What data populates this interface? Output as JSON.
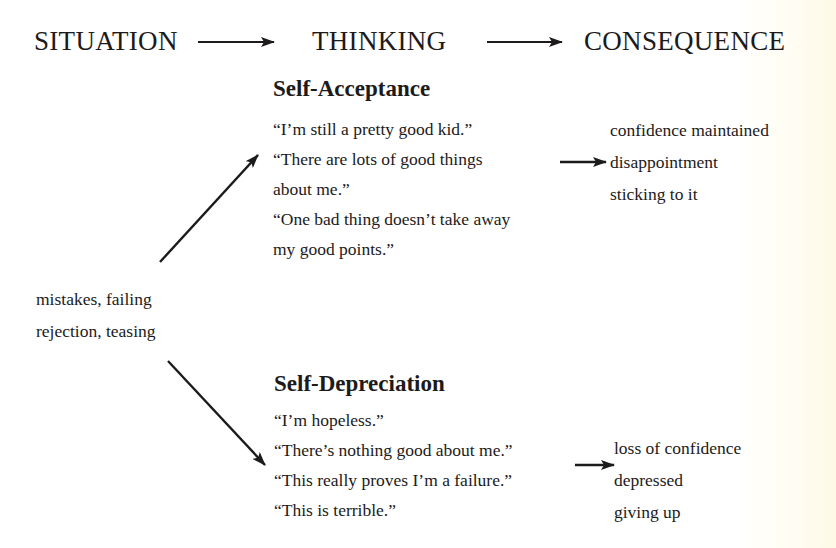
{
  "header": {
    "situation": "SITUATION",
    "thinking": "THINKING",
    "consequence": "CONSEQUENCE"
  },
  "situation": {
    "lines": [
      "mistakes, failing",
      "rejection, teasing"
    ]
  },
  "self_acceptance": {
    "title": "Self-Acceptance",
    "thoughts": [
      "“I’m still a pretty good kid.”",
      "“There are lots of good things",
      "about me.”",
      "“One bad thing doesn’t take away",
      "my good points.”"
    ],
    "consequences": [
      "confidence maintained",
      "disappointment",
      "sticking to it"
    ]
  },
  "self_depreciation": {
    "title": "Self-Depreciation",
    "thoughts": [
      "“I’m hopeless.”",
      "“There’s nothing good about me.”",
      "“This really proves I’m a failure.”",
      "“This is terrible.”"
    ],
    "consequences": [
      "loss of confidence",
      "depressed",
      "giving up"
    ]
  },
  "colors": {
    "text": "#1c1a1a",
    "background": "#ffffff"
  }
}
